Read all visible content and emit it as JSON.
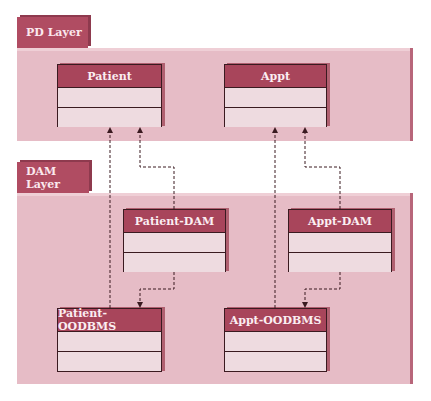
{
  "layers": [
    {
      "id": "pd",
      "label": "PD Layer"
    },
    {
      "id": "dam",
      "label": "DAM Layer"
    }
  ],
  "classes": {
    "patient": {
      "name": "Patient"
    },
    "appt": {
      "name": "Appt"
    },
    "patient_dam": {
      "name": "Patient-DAM"
    },
    "appt_dam": {
      "name": "Appt-DAM"
    },
    "patient_oodbms": {
      "name": "Patient-OODBMS"
    },
    "appt_oodbms": {
      "name": "Appt-OODBMS"
    }
  },
  "dependencies": [
    {
      "from": "Patient-DAM",
      "to": "Patient"
    },
    {
      "from": "Patient-OODBMS",
      "to": "Patient"
    },
    {
      "from": "Patient-DAM",
      "to": "Patient-OODBMS"
    },
    {
      "from": "Appt-DAM",
      "to": "Appt"
    },
    {
      "from": "Appt-OODBMS",
      "to": "Appt"
    },
    {
      "from": "Appt-DAM",
      "to": "Appt-OODBMS"
    }
  ],
  "colors": {
    "panel": "#e6bcc6",
    "tab": "#b04c62",
    "class_header": "#a8455b",
    "class_body": "#eedbe0",
    "border": "#3a1a20"
  }
}
